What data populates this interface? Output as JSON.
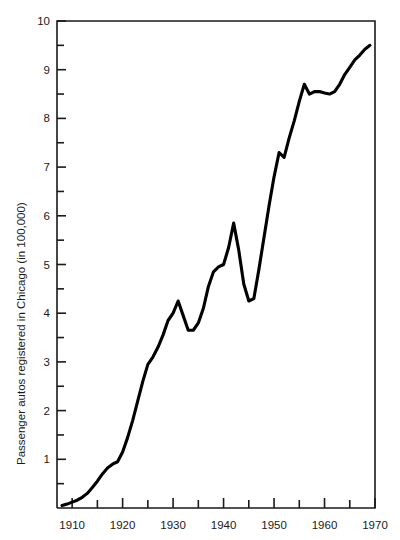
{
  "chart_data": {
    "type": "line",
    "title": "",
    "xlabel": "",
    "ylabel": "Passenger autos registered in Chicago (in 100,000)",
    "xlim": [
      1907,
      1970
    ],
    "ylim": [
      0,
      10
    ],
    "grid": false,
    "legend": null,
    "x_ticks_major": [
      1910,
      1920,
      1930,
      1940,
      1950,
      1960,
      1970
    ],
    "x_ticks_major_labels": [
      "1910",
      "1920",
      "1930",
      "1940",
      "1950",
      "1960",
      "1970"
    ],
    "x_ticks_minor": [
      1915,
      1925,
      1935,
      1945,
      1955,
      1965
    ],
    "y_ticks_major": [
      1,
      2,
      3,
      4,
      5,
      6,
      7,
      8,
      9,
      10
    ],
    "y_ticks_major_labels": [
      "1",
      "2",
      "3",
      "4",
      "5",
      "6",
      "7",
      "8",
      "9",
      "10"
    ],
    "y_ticks_minor": [
      0.5,
      1.5,
      2.5,
      3.5,
      4.5,
      5.5,
      6.5,
      7.5,
      8.5,
      9.5
    ],
    "line_color": "#000000",
    "series": [
      {
        "name": "Passenger autos registered in Chicago",
        "x": [
          1908,
          1909,
          1910,
          1911,
          1912,
          1913,
          1914,
          1915,
          1916,
          1917,
          1918,
          1919,
          1920,
          1921,
          1922,
          1923,
          1924,
          1925,
          1926,
          1927,
          1928,
          1929,
          1930,
          1931,
          1932,
          1933,
          1934,
          1935,
          1936,
          1937,
          1938,
          1939,
          1940,
          1941,
          1942,
          1943,
          1944,
          1945,
          1946,
          1947,
          1948,
          1949,
          1950,
          1951,
          1952,
          1953,
          1954,
          1955,
          1956,
          1957,
          1958,
          1959,
          1960,
          1961,
          1962,
          1963,
          1964,
          1965,
          1966,
          1967,
          1968,
          1969
        ],
        "values": [
          0.05,
          0.08,
          0.12,
          0.16,
          0.22,
          0.3,
          0.42,
          0.55,
          0.7,
          0.82,
          0.9,
          0.95,
          1.15,
          1.45,
          1.8,
          2.2,
          2.6,
          2.95,
          3.1,
          3.3,
          3.55,
          3.85,
          4.0,
          4.25,
          3.95,
          3.65,
          3.65,
          3.8,
          4.1,
          4.55,
          4.85,
          4.95,
          5.0,
          5.35,
          5.85,
          5.3,
          4.6,
          4.25,
          4.3,
          4.9,
          5.55,
          6.2,
          6.8,
          7.3,
          7.2,
          7.6,
          7.95,
          8.35,
          8.7,
          8.5,
          8.55,
          8.55,
          8.52,
          8.5,
          8.55,
          8.7,
          8.9,
          9.05,
          9.2,
          9.3,
          9.42,
          9.5
        ]
      }
    ]
  },
  "axis": {
    "x_label_text": "",
    "y_label_text": "Passenger autos registered in Chicago (in 100,000)"
  }
}
